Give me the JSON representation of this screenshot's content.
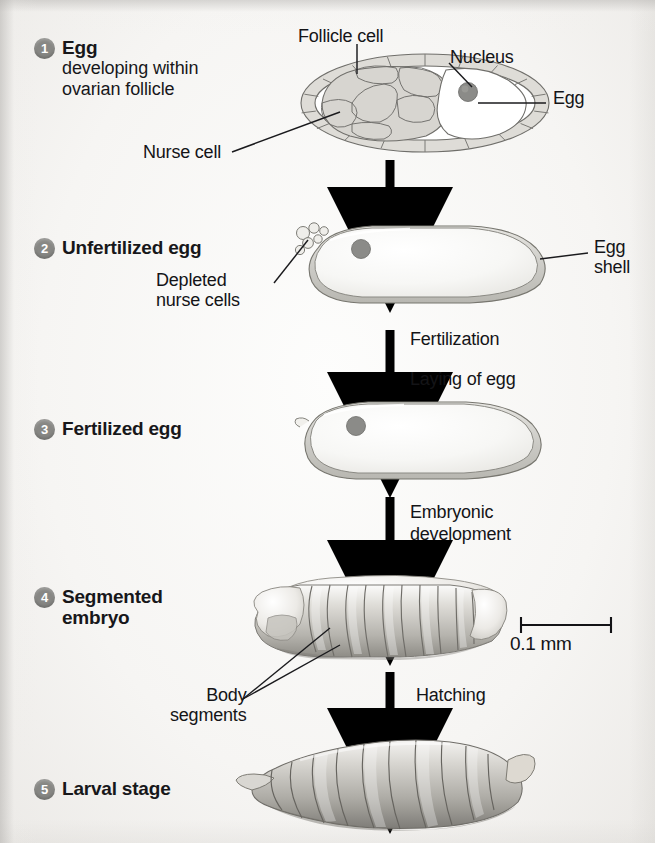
{
  "figure": {
    "background_color": "#f5f4f2"
  },
  "stages": [
    {
      "number": "1",
      "title": "Egg",
      "subtitle": "developing within\novarian follicle"
    },
    {
      "number": "2",
      "title": "Unfertilized egg",
      "subtitle": ""
    },
    {
      "number": "3",
      "title": "Fertilized egg",
      "subtitle": ""
    },
    {
      "number": "4",
      "title": "Segmented\nembryo",
      "subtitle": ""
    },
    {
      "number": "5",
      "title": "Larval stage",
      "subtitle": ""
    }
  ],
  "callouts": {
    "follicle_cell": "Follicle cell",
    "nucleus": "Nucleus",
    "egg": "Egg",
    "nurse_cell": "Nurse cell",
    "depleted_nurse_cells": "Depleted\nnurse cells",
    "egg_shell": "Egg\nshell",
    "body_segments": "Body\nsegments"
  },
  "transitions": {
    "fertilization": "Fertilization",
    "laying_of_egg": "Laying of egg",
    "embryonic_development": "Embryonic\ndevelopment",
    "hatching": "Hatching"
  },
  "scale_bar": {
    "label": "0.1 mm"
  },
  "colors": {
    "badge": "#878784",
    "text": "#141417",
    "arrow": "#000000",
    "cell_fill": "#e2e1de",
    "egg_fill": "#fafaf9",
    "shell": "#cfcec9",
    "nucleus": "#8f8f8c"
  }
}
